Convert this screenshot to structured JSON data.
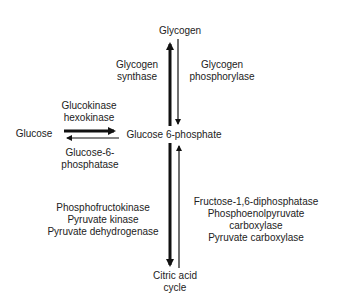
{
  "nodes": {
    "glycogen": "Glycogen",
    "glucose": "Glucose",
    "g6p": "Glucose 6-phosphate",
    "tca_line1": "Citric acid",
    "tca_line2": "cycle"
  },
  "enzymes": {
    "glycogen_synthase": [
      "Glycogen",
      "synthase"
    ],
    "glycogen_phosphorylase": [
      "Glycogen",
      "phosphorylase"
    ],
    "glucokinase": [
      "Glucokinase",
      "hexokinase"
    ],
    "g6pase": [
      "Glucose-6-",
      "phosphatase"
    ],
    "glycolysis": [
      "Phosphofructokinase",
      "Pyruvate kinase",
      "Pyruvate dehydrogenase"
    ],
    "gluconeogenesis": [
      "Fructose-1,6-diphosphatase",
      "Phosphoenolpyruvate",
      "carboxylase",
      "Pyruvate carboxylase"
    ]
  }
}
